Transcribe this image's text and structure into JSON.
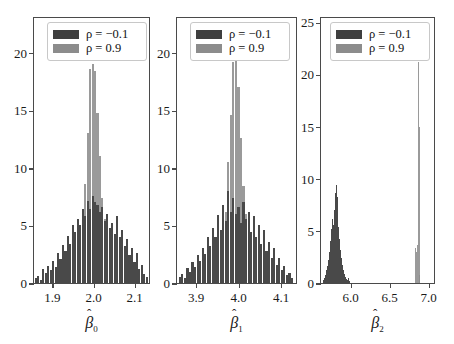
{
  "figure": {
    "type": "multi-panel-histogram",
    "background": "#ffffff",
    "colors": {
      "dark": "#494949",
      "gray": "#8c8c8c",
      "axis": "#4a4a4a"
    }
  },
  "legend": {
    "entries": [
      {
        "label": "ρ = −0.1",
        "rho": -0.1,
        "color": "#494949",
        "swatch": "dark"
      },
      {
        "label": "ρ = 0.9",
        "rho": 0.9,
        "color": "#8c8c8c",
        "swatch": "gray"
      }
    ],
    "position": "upper-left"
  },
  "chart_data": [
    {
      "type": "bar",
      "subplot": 1,
      "title": "",
      "xlabel": "β̂₀",
      "xlabel_symbol": "β",
      "xlabel_subscript": "0",
      "ylabel": "",
      "xlim": [
        1.855,
        2.135
      ],
      "ylim": [
        0,
        23.2
      ],
      "xticks": [
        1.9,
        2.0,
        2.1
      ],
      "xticklabels": [
        "1.9",
        "2.0",
        "2.1"
      ],
      "yticks": [
        0,
        5,
        10,
        15,
        20
      ],
      "yticklabels": [
        "0",
        "5",
        "10",
        "15",
        "20"
      ],
      "grid": false,
      "series": [
        {
          "name": "ρ = −0.1",
          "color": "#494949",
          "bin_centers": [
            1.86,
            1.866,
            1.872,
            1.878,
            1.884,
            1.89,
            1.896,
            1.902,
            1.908,
            1.914,
            1.92,
            1.926,
            1.932,
            1.938,
            1.944,
            1.95,
            1.956,
            1.962,
            1.968,
            1.974,
            1.98,
            1.986,
            1.992,
            1.998,
            2.004,
            2.01,
            2.016,
            2.022,
            2.028,
            2.034,
            2.04,
            2.046,
            2.052,
            2.058,
            2.064,
            2.07,
            2.076,
            2.082,
            2.088,
            2.094,
            2.1,
            2.106,
            2.112,
            2.118,
            2.124,
            2.13
          ],
          "values": [
            0.4,
            0.6,
            0.3,
            1.2,
            0.9,
            1.5,
            1.1,
            1.9,
            1.4,
            2.6,
            2.1,
            3.3,
            2.8,
            4.1,
            3.4,
            5.0,
            4.4,
            5.6,
            5.0,
            6.4,
            5.8,
            7.1,
            6.4,
            7.6,
            7.0,
            6.8,
            6.2,
            6.6,
            5.4,
            6.0,
            4.8,
            5.2,
            4.3,
            5.8,
            4.0,
            4.6,
            3.2,
            3.8,
            2.4,
            3.0,
            1.8,
            2.6,
            1.2,
            1.6,
            0.8,
            0.5
          ]
        },
        {
          "name": "ρ = 0.9",
          "color": "#8c8c8c",
          "bin_centers": [
            1.95,
            1.956,
            1.962,
            1.968,
            1.974,
            1.98,
            1.986,
            1.992,
            1.998,
            2.004,
            2.01,
            2.016,
            2.022,
            2.028,
            2.034,
            2.04,
            2.046,
            2.052
          ],
          "values": [
            0.6,
            1.1,
            2.0,
            3.4,
            5.2,
            8.6,
            13.0,
            18.6,
            19.0,
            18.4,
            14.8,
            11.0,
            7.4,
            5.6,
            4.0,
            2.6,
            1.4,
            0.6
          ]
        }
      ]
    },
    {
      "type": "bar",
      "subplot": 2,
      "title": "",
      "xlabel": "β̂₁",
      "xlabel_symbol": "β",
      "xlabel_subscript": "1",
      "ylabel": "",
      "xlim": [
        3.855,
        4.135
      ],
      "ylim": [
        0,
        23.2
      ],
      "xticks": [
        3.9,
        4.0,
        4.1
      ],
      "xticklabels": [
        "3.9",
        "4.0",
        "4.1"
      ],
      "yticks": [
        0,
        5,
        10,
        15,
        20
      ],
      "yticklabels": [
        "0",
        "5",
        "10",
        "15",
        "20"
      ],
      "grid": false,
      "series": [
        {
          "name": "ρ = −0.1",
          "color": "#494949",
          "bin_centers": [
            3.862,
            3.868,
            3.874,
            3.88,
            3.886,
            3.892,
            3.898,
            3.904,
            3.91,
            3.916,
            3.922,
            3.928,
            3.934,
            3.94,
            3.946,
            3.952,
            3.958,
            3.964,
            3.97,
            3.976,
            3.982,
            3.988,
            3.994,
            4.0,
            4.006,
            4.012,
            4.018,
            4.024,
            4.03,
            4.036,
            4.042,
            4.048,
            4.054,
            4.06,
            4.066,
            4.072,
            4.078,
            4.084,
            4.09,
            4.096,
            4.102,
            4.108,
            4.114,
            4.12,
            4.126
          ],
          "values": [
            0.5,
            0.8,
            0.4,
            1.3,
            1.0,
            1.8,
            1.4,
            2.4,
            1.9,
            3.0,
            2.5,
            4.0,
            3.2,
            4.8,
            4.0,
            5.9,
            4.6,
            6.8,
            5.4,
            8.0,
            6.2,
            7.4,
            6.0,
            6.6,
            5.2,
            7.0,
            5.6,
            6.2,
            4.4,
            5.8,
            4.0,
            5.0,
            3.4,
            4.6,
            2.8,
            3.6,
            2.2,
            3.0,
            1.6,
            2.2,
            1.1,
            1.5,
            0.7,
            0.9,
            0.4
          ]
        },
        {
          "name": "ρ = 0.9",
          "color": "#8c8c8c",
          "bin_centers": [
            3.946,
            3.952,
            3.958,
            3.964,
            3.97,
            3.976,
            3.982,
            3.988,
            3.994,
            4.0,
            4.006,
            4.012,
            4.018,
            4.024,
            4.03,
            4.036,
            4.042,
            4.048
          ],
          "values": [
            0.7,
            1.3,
            2.2,
            3.8,
            6.2,
            10.5,
            14.6,
            19.2,
            19.4,
            17.0,
            12.6,
            8.4,
            6.0,
            4.4,
            3.0,
            1.8,
            1.0,
            0.5
          ]
        }
      ]
    },
    {
      "type": "bar",
      "subplot": 3,
      "title": "",
      "xlabel": "β̂₂",
      "xlabel_symbol": "β",
      "xlabel_subscript": "2",
      "ylabel": "",
      "xlim": [
        5.62,
        7.07
      ],
      "ylim": [
        0,
        25.6
      ],
      "xticks": [
        6.0,
        6.5,
        7.0
      ],
      "xticklabels": [
        "6.0",
        "6.5",
        "7.0"
      ],
      "yticks": [
        0,
        5,
        10,
        15,
        20,
        25
      ],
      "yticklabels": [
        "0",
        "5",
        "10",
        "15",
        "20",
        "25"
      ],
      "grid": false,
      "series": [
        {
          "name": "ρ = −0.1",
          "color": "#494949",
          "bin_centers": [
            5.66,
            5.672,
            5.684,
            5.696,
            5.708,
            5.72,
            5.732,
            5.744,
            5.756,
            5.768,
            5.78,
            5.792,
            5.804,
            5.816,
            5.828,
            5.84,
            5.852,
            5.864,
            5.876,
            5.888,
            5.9,
            5.912,
            5.924,
            5.936,
            5.948,
            5.96,
            5.972,
            5.984
          ],
          "values": [
            0.3,
            0.5,
            0.8,
            1.2,
            1.6,
            2.2,
            3.0,
            4.0,
            5.2,
            6.1,
            5.6,
            7.0,
            8.6,
            9.4,
            8.2,
            6.8,
            5.4,
            4.2,
            3.2,
            2.4,
            1.7,
            1.2,
            0.9,
            0.6,
            0.4,
            0.3,
            0.5,
            0.2
          ]
        },
        {
          "name": "ρ = 0.9",
          "color": "#8c8c8c",
          "bin_centers": [
            6.832,
            6.844,
            6.856,
            6.868,
            6.88,
            6.892
          ],
          "values": [
            3.4,
            3.0,
            3.6,
            21.2,
            15.0,
            0.8
          ]
        }
      ]
    }
  ]
}
